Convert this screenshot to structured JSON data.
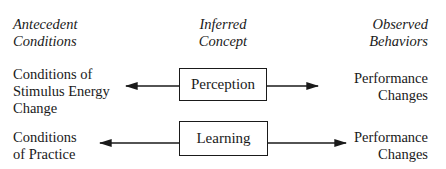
{
  "headers": {
    "left": [
      "Antecedent",
      "Conditions"
    ],
    "middle": [
      "Inferred",
      "Concept"
    ],
    "right": [
      "Observed",
      "Behaviors"
    ]
  },
  "rows": [
    {
      "antecedent": [
        "Conditions of",
        "Stimulus Energy",
        "Change"
      ],
      "concept": "Perception",
      "behavior": [
        "Performance",
        "Changes"
      ]
    },
    {
      "antecedent": [
        "Conditions",
        "of Practice"
      ],
      "concept": "Learning",
      "behavior": [
        "Performance",
        "Changes"
      ]
    }
  ]
}
